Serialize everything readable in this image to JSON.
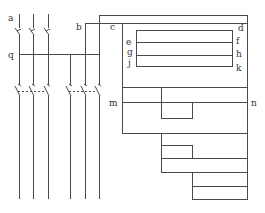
{
  "diagram": {
    "type": "electrical schematic",
    "stroke_color": "#4a4a4a",
    "background": "#ffffff",
    "labels": {
      "a": "a",
      "b": "b",
      "c": "c",
      "d": "d",
      "e": "e",
      "f": "f",
      "g": "g",
      "h": "h",
      "j": "j",
      "k": "k",
      "m": "m",
      "n": "n",
      "q": "q"
    },
    "feed_lines_count": 6,
    "upper_switches_count": 3,
    "lower_switch_groups": 2
  }
}
